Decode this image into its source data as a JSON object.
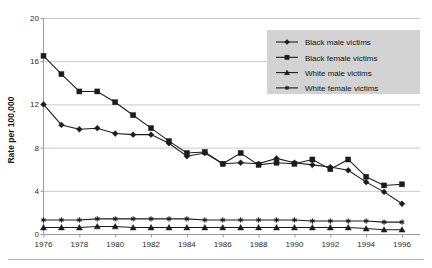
{
  "chart_data": {
    "type": "line",
    "title": "",
    "xlabel": "",
    "ylabel": "Rate per 100,000",
    "x": [
      1976,
      1977,
      1978,
      1979,
      1980,
      1981,
      1982,
      1983,
      1984,
      1985,
      1986,
      1987,
      1988,
      1989,
      1990,
      1991,
      1992,
      1993,
      1994,
      1995,
      1996
    ],
    "xlim": [
      1976,
      1996
    ],
    "ylim": [
      0,
      20
    ],
    "yticks": [
      0,
      4,
      8,
      12,
      16,
      20
    ],
    "xticks": [
      1976,
      1978,
      1980,
      1982,
      1984,
      1986,
      1988,
      1990,
      1992,
      1994,
      1996
    ],
    "xtick_labels": [
      "1976",
      "1978",
      "1980",
      "1982",
      "1984",
      "1986",
      "1988",
      "1990",
      "1992",
      "1994",
      "1996"
    ],
    "ytick_labels": [
      "0",
      "4",
      "8",
      "12",
      "16",
      "20"
    ],
    "grid": true,
    "grid_axis": "y",
    "legend_position": "top-right",
    "series": [
      {
        "name": "Black male victims",
        "marker": "diamond",
        "color": "#1c1c1c",
        "values": [
          12.0,
          10.1,
          9.7,
          9.8,
          9.3,
          9.2,
          9.2,
          8.4,
          7.2,
          7.5,
          6.5,
          6.6,
          6.5,
          7.0,
          6.6,
          6.4,
          6.2,
          5.9,
          4.8,
          3.9,
          2.8
        ]
      },
      {
        "name": "Black female victims",
        "marker": "square",
        "color": "#1c1c1c",
        "values": [
          16.5,
          14.8,
          13.2,
          13.2,
          12.2,
          11.0,
          9.8,
          8.6,
          7.5,
          7.6,
          6.5,
          7.5,
          6.4,
          6.6,
          6.5,
          6.9,
          6.0,
          6.9,
          5.3,
          4.5,
          4.6
        ]
      },
      {
        "name": "White male victims",
        "marker": "triangle",
        "color": "#1c1c1c",
        "values": [
          0.6,
          0.6,
          0.6,
          0.7,
          0.7,
          0.6,
          0.6,
          0.6,
          0.6,
          0.6,
          0.6,
          0.6,
          0.6,
          0.6,
          0.6,
          0.6,
          0.6,
          0.6,
          0.5,
          0.4,
          0.4
        ]
      },
      {
        "name": "White female victims",
        "marker": "asterisk",
        "color": "#1c1c1c",
        "values": [
          1.3,
          1.3,
          1.3,
          1.4,
          1.4,
          1.4,
          1.4,
          1.4,
          1.4,
          1.3,
          1.3,
          1.3,
          1.3,
          1.3,
          1.3,
          1.2,
          1.2,
          1.2,
          1.2,
          1.1,
          1.1
        ]
      }
    ]
  },
  "axis": {
    "y_title": "Rate per 100,000"
  },
  "legend": {
    "items": [
      {
        "label": "Black male victims"
      },
      {
        "label": "Black female victims"
      },
      {
        "label": "White male victims"
      },
      {
        "label": "White female victims"
      }
    ]
  }
}
